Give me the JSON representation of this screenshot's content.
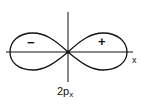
{
  "diagram": {
    "orbital_label": "2p",
    "orbital_subscript": "x",
    "axis_label": "x",
    "left_lobe_sign": "−",
    "right_lobe_sign": "+",
    "line_color": "#111111",
    "background": "#ffffff"
  }
}
